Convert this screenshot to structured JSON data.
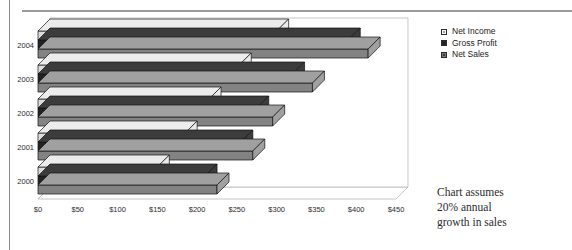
{
  "chart_data": {
    "type": "bar",
    "orientation": "horizontal",
    "style": "3d-clustered-bar",
    "title": "",
    "xlabel": "",
    "ylabel": "",
    "categories": [
      "2000",
      "2001",
      "2002",
      "2003",
      "2004"
    ],
    "series": [
      {
        "name": "Net Sales",
        "values": [
          225,
          270,
          295,
          345,
          415
        ],
        "color": "#8a8a8a"
      },
      {
        "name": "Gross Profit",
        "values": [
          210,
          255,
          275,
          320,
          390
        ],
        "color": "#2b2b2b"
      },
      {
        "name": "Net Income",
        "values": [
          150,
          185,
          215,
          253,
          300
        ],
        "color": "#d9d9d9"
      }
    ],
    "legend": [
      "Net Income",
      "Gross Profit",
      "Net Sales"
    ],
    "xlim": [
      0,
      450
    ],
    "xticks": [
      "$0",
      "$50",
      "$100",
      "$150",
      "$200",
      "$250",
      "$300",
      "$350",
      "$400",
      "$450"
    ],
    "xtick_values": [
      0,
      50,
      100,
      150,
      200,
      250,
      300,
      350,
      400,
      450
    ],
    "grid": false,
    "legend_position": "right-top",
    "annotation": [
      "Chart assumes",
      "20% annual",
      "growth in sales"
    ]
  },
  "legend": {
    "items": [
      {
        "label": "Net Income",
        "color": "#e4e4e4"
      },
      {
        "label": "Gross Profit",
        "color": "#2b2b2b"
      },
      {
        "label": "Net Sales",
        "color": "#8a8a8a"
      }
    ]
  },
  "note": {
    "line1": "Chart assumes",
    "line2": "20% annual",
    "line3": "growth in sales"
  },
  "axes": {
    "y_labels": [
      "2004",
      "2003",
      "2002",
      "2001",
      "2000"
    ],
    "x_labels": [
      "$0",
      "$50",
      "$100",
      "$150",
      "$200",
      "$250",
      "$300",
      "$350",
      "$400",
      "$450"
    ]
  },
  "colors": {
    "net_income_top": "#ececec",
    "net_income_front": "#dcdcdc",
    "gross_profit_top": "#3c3c3c",
    "gross_profit_front": "#232323",
    "net_sales_top": "#a0a0a0",
    "net_sales_front": "#838383",
    "outline": "#111111",
    "axis": "#b8b8b8",
    "rule": "#9a9a9a"
  }
}
